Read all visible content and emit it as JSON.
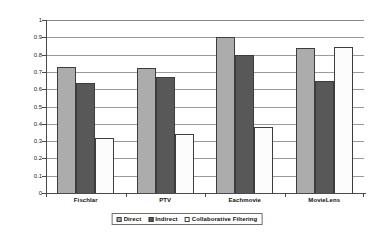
{
  "chart_data": {
    "type": "bar",
    "title": "",
    "xlabel": "",
    "ylabel": "Correlation",
    "ylim": [
      0,
      1
    ],
    "yticks": [
      "0",
      "0.1",
      "0.2",
      "0.3",
      "0.4",
      "0.5",
      "0.6",
      "0.7",
      "0.8",
      "0.9",
      "1"
    ],
    "grid": true,
    "legend_position": "bottom",
    "categories": [
      "Fischlar",
      "PTV",
      "Eachmovie",
      "MovieLens"
    ],
    "series": [
      {
        "name": "Direct",
        "color": "#acacac",
        "values": [
          0.73,
          0.725,
          0.9,
          0.84
        ]
      },
      {
        "name": "Indirect",
        "color": "#585858",
        "values": [
          0.635,
          0.67,
          0.795,
          0.645
        ]
      },
      {
        "name": "Collaborative Filtering",
        "color": "#ffffff",
        "values": [
          0.32,
          0.34,
          0.38,
          0.845
        ]
      }
    ]
  },
  "legend": {
    "items": [
      {
        "label": "Direct"
      },
      {
        "label": "Indirect"
      },
      {
        "label": "Collaborative Filtering"
      }
    ]
  }
}
